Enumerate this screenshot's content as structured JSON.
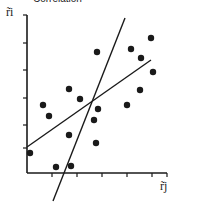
{
  "chart_data": {
    "type": "scatter",
    "title": "Correlation",
    "xlabel": "r̃j",
    "ylabel": "r̃i",
    "grid": false,
    "legend": null,
    "axis_pixels": {
      "origin": [
        27,
        173
      ],
      "x_end": 167,
      "y_end": 15
    },
    "x_ticks_px": [
      52,
      77,
      102,
      127,
      152
    ],
    "y_ticks_px": [
      43,
      70,
      98,
      125,
      148
    ],
    "points_px": [
      [
        30,
        153
      ],
      [
        43,
        105
      ],
      [
        49,
        116
      ],
      [
        56,
        167
      ],
      [
        71,
        166
      ],
      [
        69,
        89
      ],
      [
        80,
        99
      ],
      [
        69,
        135
      ],
      [
        97,
        52
      ],
      [
        94,
        120
      ],
      [
        98,
        109
      ],
      [
        96,
        143
      ],
      [
        131,
        49
      ],
      [
        151,
        38
      ],
      [
        141,
        58
      ],
      [
        153,
        72
      ],
      [
        140,
        90
      ],
      [
        127,
        105
      ]
    ],
    "lines_px": [
      {
        "name": "regression-line-shallow",
        "x1": 27,
        "y1": 147,
        "x2": 151,
        "y2": 60
      },
      {
        "name": "regression-line-steep",
        "x1": 53,
        "y1": 201,
        "x2": 125,
        "y2": 18
      }
    ]
  },
  "labels": {
    "title": "Correlation",
    "x_axis": "r̃j",
    "y_axis": "r̃i"
  },
  "colors": {
    "ink": "#1a1a1a",
    "background": "#ffffff"
  }
}
